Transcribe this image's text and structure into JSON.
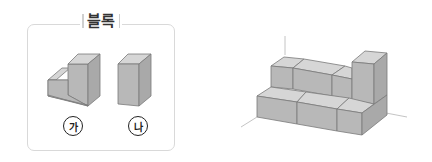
{
  "panel": {
    "title": "블록",
    "blocks": [
      {
        "id": "ga",
        "label": "가",
        "shape": "L-shaped block"
      },
      {
        "id": "na",
        "label": "나",
        "shape": "tall rectangular block"
      }
    ]
  },
  "colors": {
    "block_front": "#b8b8b8",
    "block_top": "#d6d6d6",
    "block_side": "#a9a9a9",
    "edge": "#7a7a7a",
    "panel_border": "#d9d9d9",
    "axis": "#bdbdbd"
  }
}
